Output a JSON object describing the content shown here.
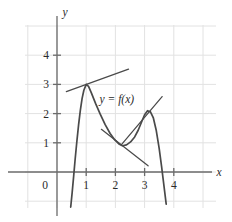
{
  "figure": {
    "name": "calculus-tangent-line-graph",
    "background": "#ffffff"
  },
  "chart_data": {
    "type": "line",
    "title": "",
    "xlabel": "x",
    "ylabel": "y",
    "xlim": [
      -0.55,
      4.75
    ],
    "ylim": [
      -1.25,
      4.85
    ],
    "grid": true,
    "grid_color": "#e2e2e2",
    "axis_color": "#6b6b6b",
    "curve_color": "#4a4a4a",
    "tangent_color": "#4a4a4a",
    "legend": "none",
    "annotations": [
      {
        "text": "y = f(x)",
        "x": 2.05,
        "y": 2.35
      }
    ],
    "xticks": [
      0,
      1,
      2,
      3,
      4
    ],
    "xtick_labels": [
      "0",
      "1",
      "2",
      "3",
      "4"
    ],
    "yticks": [
      1,
      2,
      3,
      4
    ],
    "ytick_labels": [
      "1",
      "2",
      "3",
      "4"
    ],
    "origin_label": "0",
    "series": [
      {
        "name": "f(x)",
        "type": "curve",
        "points": [
          [
            0.47,
            -1.2
          ],
          [
            0.52,
            -0.7
          ],
          [
            0.57,
            -0.15
          ],
          [
            0.62,
            0.42
          ],
          [
            0.68,
            1.05
          ],
          [
            0.74,
            1.62
          ],
          [
            0.8,
            2.12
          ],
          [
            0.86,
            2.52
          ],
          [
            0.92,
            2.8
          ],
          [
            1.0,
            3.0
          ],
          [
            1.08,
            2.93
          ],
          [
            1.18,
            2.7
          ],
          [
            1.32,
            2.35
          ],
          [
            1.48,
            1.98
          ],
          [
            1.65,
            1.62
          ],
          [
            1.82,
            1.32
          ],
          [
            1.98,
            1.1
          ],
          [
            2.12,
            0.96
          ],
          [
            2.24,
            0.9
          ],
          [
            2.38,
            0.93
          ],
          [
            2.52,
            1.03
          ],
          [
            2.66,
            1.2
          ],
          [
            2.78,
            1.43
          ],
          [
            2.9,
            1.72
          ],
          [
            3.0,
            1.96
          ],
          [
            3.1,
            2.1
          ],
          [
            3.2,
            2.06
          ],
          [
            3.3,
            1.85
          ],
          [
            3.4,
            1.42
          ],
          [
            3.5,
            0.8
          ],
          [
            3.58,
            0.2
          ],
          [
            3.66,
            -0.45
          ],
          [
            3.74,
            -1.1
          ]
        ]
      },
      {
        "name": "tangent-at-first-peak",
        "type": "tangent",
        "tangent_point": [
          1.0,
          3.0
        ],
        "slope": 0.36,
        "x_range": [
          0.32,
          2.45
        ]
      },
      {
        "name": "tangent-at-local-minimum",
        "type": "tangent",
        "tangent_point": [
          2.24,
          0.9
        ],
        "slope": -0.78,
        "x_range": [
          1.52,
          3.12
        ]
      },
      {
        "name": "tangent-on-rising-branch",
        "type": "tangent",
        "tangent_point": [
          2.92,
          1.78
        ],
        "slope": 1.18,
        "x_range": [
          2.2,
          3.6
        ]
      }
    ]
  }
}
